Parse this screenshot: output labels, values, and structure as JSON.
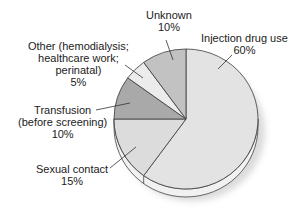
{
  "chart_data": {
    "type": "pie",
    "title": "",
    "categories": [
      "Injection drug use",
      "Sexual contact",
      "Transfusion (before screening)",
      "Other (hemodialysis; healthcare work; perinatal)",
      "Unknown"
    ],
    "values": [
      60,
      15,
      10,
      5,
      10
    ],
    "unit": "%",
    "colors": [
      "#e3e3e3",
      "#dcdcdc",
      "#a9a9a9",
      "#ececec",
      "#c2c2c2"
    ],
    "start_angle_deg": 0,
    "direction": "clockwise",
    "style": "3d-tilted",
    "legend": "none (leader-line labels)"
  },
  "labels": {
    "unknown": {
      "name": "Unknown",
      "pct": "10%"
    },
    "injection": {
      "name": "Injection drug use",
      "pct": "60%"
    },
    "other": {
      "line1": "Other (hemodialysis;",
      "line2": "healthcare work;",
      "line3": "perinatal)",
      "pct": "5%"
    },
    "transfusion": {
      "line1": "Transfusion",
      "line2": "(before screening)",
      "pct": "10%"
    },
    "sexual": {
      "name": "Sexual contact",
      "pct": "15%"
    }
  }
}
